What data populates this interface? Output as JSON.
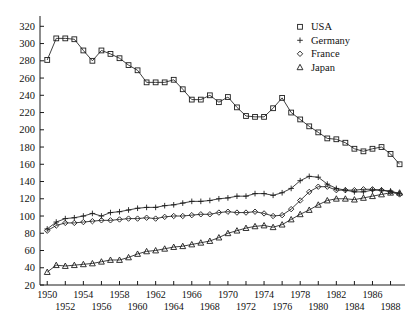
{
  "chart_data": {
    "type": "line",
    "title": "",
    "xlabel": "",
    "ylabel": "",
    "xlim": [
      1949.2,
      1989.6
    ],
    "ylim": [
      20,
      325
    ],
    "grid": false,
    "legend_position": "top-right",
    "x": [
      1950,
      1951,
      1952,
      1953,
      1954,
      1955,
      1956,
      1957,
      1958,
      1959,
      1960,
      1961,
      1962,
      1963,
      1964,
      1965,
      1966,
      1967,
      1968,
      1969,
      1970,
      1971,
      1972,
      1973,
      1974,
      1975,
      1976,
      1977,
      1978,
      1979,
      1980,
      1981,
      1982,
      1983,
      1984,
      1985,
      1986,
      1987,
      1988,
      1989
    ],
    "xtick_values": [
      1950,
      1951,
      1952,
      1953,
      1954,
      1955,
      1956,
      1957,
      1958,
      1959,
      1960,
      1961,
      1962,
      1963,
      1964,
      1965,
      1966,
      1967,
      1968,
      1969,
      1970,
      1971,
      1972,
      1973,
      1974,
      1975,
      1976,
      1977,
      1978,
      1979,
      1980,
      1981,
      1982,
      1983,
      1984,
      1985,
      1986,
      1987,
      1988,
      1989
    ],
    "xtick_labels_top": [
      "1950",
      "1954",
      "1958",
      "1962",
      "1966",
      "1970",
      "1974",
      "1978",
      "1982",
      "1986"
    ],
    "xtick_labels_bottom": [
      "1952",
      "1956",
      "1960",
      "1964",
      "1968",
      "1972",
      "1976",
      "1980",
      "1984",
      "1988"
    ],
    "ytick_labels": [
      "320",
      "300",
      "280",
      "260",
      "240",
      "220",
      "200",
      "180",
      "160",
      "140",
      "120",
      "100",
      "80",
      "60",
      "40",
      "20"
    ],
    "ytick_values": [
      320,
      300,
      280,
      260,
      240,
      220,
      200,
      180,
      160,
      140,
      120,
      100,
      80,
      60,
      40,
      20
    ],
    "series": [
      {
        "name": "USA",
        "marker": "square",
        "values": [
          281,
          306,
          306,
          305,
          292,
          280,
          292,
          288,
          283,
          275,
          269,
          255,
          255,
          255,
          258,
          247,
          235,
          235,
          240,
          232,
          238,
          226,
          216,
          215,
          215,
          225,
          237,
          220,
          212,
          204,
          197,
          190,
          189,
          185,
          178,
          175,
          178,
          180,
          172,
          160
        ]
      },
      {
        "name": "Germany",
        "marker": "plus",
        "values": [
          85,
          93,
          97,
          98,
          100,
          103,
          100,
          104,
          105,
          107,
          109,
          110,
          110,
          112,
          113,
          115,
          117,
          117,
          118,
          120,
          121,
          123,
          123,
          126,
          126,
          124,
          127,
          132,
          141,
          146,
          145,
          137,
          132,
          130,
          128,
          128,
          130,
          130,
          129,
          126
        ]
      },
      {
        "name": "France",
        "marker": "diamond",
        "values": [
          83,
          89,
          92,
          92,
          93,
          94,
          95,
          95,
          96,
          97,
          97,
          98,
          97,
          99,
          100,
          100,
          101,
          102,
          102,
          104,
          105,
          104,
          104,
          105,
          103,
          100,
          101,
          108,
          118,
          128,
          134,
          134,
          130,
          130,
          130,
          131,
          131,
          130,
          128,
          125
        ]
      },
      {
        "name": "Japan",
        "marker": "triangle",
        "values": [
          35,
          43,
          42,
          43,
          44,
          45,
          47,
          49,
          49,
          52,
          56,
          59,
          60,
          62,
          64,
          65,
          67,
          69,
          71,
          75,
          80,
          83,
          86,
          88,
          89,
          87,
          90,
          96,
          102,
          107,
          113,
          118,
          120,
          120,
          119,
          121,
          123,
          125,
          127,
          127
        ]
      }
    ]
  },
  "legend": {
    "entries": [
      {
        "label": "USA",
        "marker": "square"
      },
      {
        "label": "Germany",
        "marker": "plus"
      },
      {
        "label": "France",
        "marker": "diamond"
      },
      {
        "label": "Japan",
        "marker": "triangle"
      }
    ]
  }
}
